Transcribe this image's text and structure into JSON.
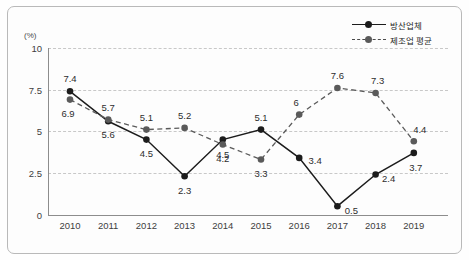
{
  "chart_data": {
    "type": "line",
    "title": "",
    "subtitle": "",
    "xlabel": "",
    "ylabel": "",
    "unit_label": "(%)",
    "categories": [
      "2010",
      "2011",
      "2012",
      "2013",
      "2014",
      "2015",
      "2016",
      "2017",
      "2018",
      "2019"
    ],
    "ylim": [
      0,
      10
    ],
    "yticks": [
      "0",
      "2.5",
      "5",
      "7.5",
      "10"
    ],
    "ytick_values": [
      0,
      2.5,
      5,
      7.5,
      10
    ],
    "grid": true,
    "grid_style": "dashed",
    "legend_position": "top-right",
    "series": [
      {
        "name": "방산업체",
        "style": "solid",
        "color": "#1c1c1c",
        "marker": "circle",
        "values": [
          7.4,
          5.6,
          4.5,
          2.3,
          4.5,
          5.1,
          3.4,
          0.5,
          2.4,
          3.7
        ],
        "labels": [
          "7.4",
          "5.6",
          "4.5",
          "2.3",
          "4.5",
          "5.1",
          "3.4",
          "0.5",
          "2.4",
          "3.7"
        ]
      },
      {
        "name": "제조업 평균",
        "style": "dashed",
        "color": "#5a5a5a",
        "marker": "circle",
        "values": [
          6.9,
          5.7,
          5.1,
          5.2,
          4.2,
          3.3,
          6,
          7.6,
          7.3,
          4.4
        ],
        "labels": [
          "6.9",
          "5.7",
          "5.1",
          "5.2",
          "4.2",
          "3.3",
          "6",
          "7.6",
          "7.3",
          "4.4"
        ]
      }
    ]
  },
  "colors": {
    "frame": "#b9b9b9",
    "axis": "#8d8d8d",
    "grid": "#c8c8c8",
    "series_solid": "#1c1c1c",
    "series_dashed": "#5a5a5a",
    "text": "#2d2d2d",
    "background": "#fdfdfd"
  }
}
